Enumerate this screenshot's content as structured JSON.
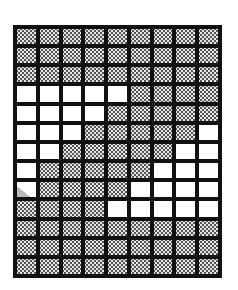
{
  "grid": {
    "rows": 13,
    "cols": 9,
    "legend": {
      "S": "stippled",
      "W": "white",
      "P": "partially-stippled"
    },
    "colors": {
      "line": "#111111",
      "stipple": "#555555",
      "white": "#ffffff"
    },
    "pattern": [
      "SSSSSSSSS",
      "SSSSSSSSS",
      "SSSSSSSSS",
      "WWWWWSSSS",
      "WWWWSSSSS",
      "WWWSSSSSW",
      "WWSSSSSWW",
      "WSSSSSWWW",
      "PSSSSWWWW",
      "SSSSWWWWW",
      "SSSSSSSSS",
      "SSSSSSSSS",
      "SSSSSSSSS"
    ]
  }
}
